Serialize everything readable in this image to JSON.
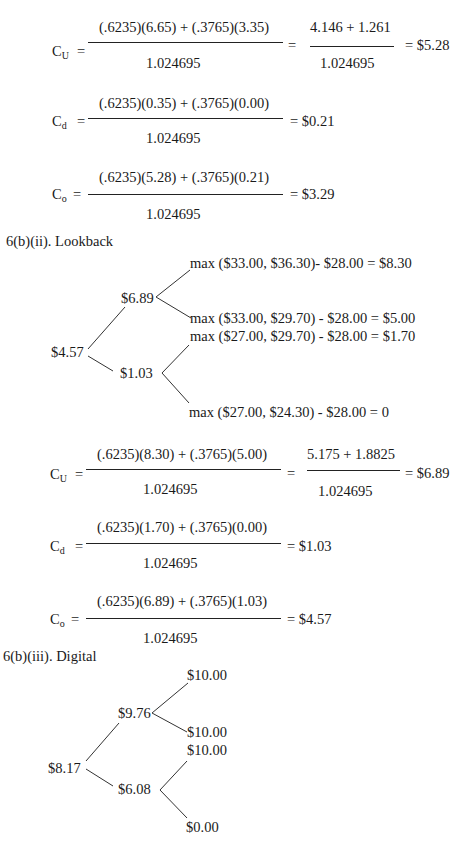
{
  "lookback_prev": {
    "cu": {
      "label": "C",
      "sub": "U",
      "eq": "=",
      "numerator": "(.6235)(6.65) + (.3765)(3.35)",
      "denominator": "1.024695",
      "eq2": "=",
      "numerator2": "4.146 + 1.261",
      "denominator2": "1.024695",
      "result": "= $5.28"
    },
    "cd": {
      "label": "C",
      "sub": "d",
      "eq": "=",
      "numerator": "(.6235)(0.35) + (.3765)(0.00)",
      "denominator": "1.024695",
      "result": "=  $0.21"
    },
    "co": {
      "label": "C",
      "sub": "o",
      "eq": "=",
      "numerator": "(.6235)(5.28) + (.3765)(0.21)",
      "denominator": "1.024695",
      "result": "=  $3.29"
    }
  },
  "lookback": {
    "heading": "6(b)(ii). Lookback",
    "tree": {
      "root": "$4.57",
      "up": "$6.89",
      "down": "$1.03",
      "uu": "max ($33.00, $36.30)- $28.00 = $8.30",
      "ud": "max ($33.00, $29.70) - $28.00 = $5.00",
      "du": "max ($27.00, $29.70) - $28.00 = $1.70",
      "dd": "max ($27.00, $24.30) - $28.00 = 0"
    },
    "cu": {
      "label": "C",
      "sub": "U",
      "eq": "=",
      "numerator": "(.6235)(8.30) + (.3765)(5.00)",
      "denominator": "1.024695",
      "eq2": "=",
      "numerator2": "5.175 + 1.8825",
      "denominator2": "1.024695",
      "result": "= $6.89"
    },
    "cd": {
      "label": "C",
      "sub": "d",
      "eq": "=",
      "numerator": "(.6235)(1.70) + (.3765)(0.00)",
      "denominator": "1.024695",
      "result": "=  $1.03"
    },
    "co": {
      "label": "C",
      "sub": "o",
      "eq": "=",
      "numerator": "(.6235)(6.89) + (.3765)(1.03)",
      "denominator": "1.024695",
      "result": "=  $4.57"
    }
  },
  "digital": {
    "heading": "6(b)(iii). Digital",
    "tree": {
      "root": "$8.17",
      "up": "$9.76",
      "down": "$6.08",
      "uu": "$10.00",
      "ud": "$10.00",
      "du": "$10.00",
      "dd": "$0.00"
    }
  }
}
